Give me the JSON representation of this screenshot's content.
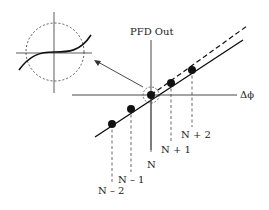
{
  "diagram": {
    "y_axis_label": "PFD Out",
    "x_axis_label": "Δϕ",
    "points": [
      {
        "label": "N – 2",
        "x": 112,
        "y": 124
      },
      {
        "label": "N – 1",
        "x": 131,
        "y": 109
      },
      {
        "label": "N",
        "x": 151,
        "y": 95
      },
      {
        "label": "N + 1",
        "x": 171,
        "y": 83
      },
      {
        "label": "N + 2",
        "x": 192,
        "y": 70
      }
    ],
    "inset": "magnified view of nonlinearity near origin (dashed circle)"
  }
}
